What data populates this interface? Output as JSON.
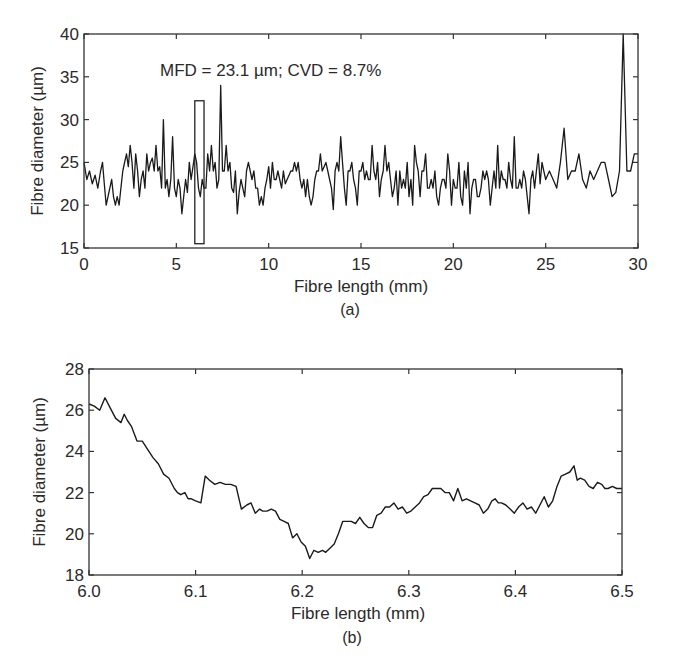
{
  "chart_data": [
    {
      "id": "a",
      "type": "line",
      "caption": "(a)",
      "title": "",
      "annotation": "MFD = 23.1 µm; CVD = 8.7%",
      "xlabel": "Fibre length (mm)",
      "ylabel": "Fibre diameter (µm)",
      "xlim": [
        0,
        30
      ],
      "ylim": [
        15,
        40
      ],
      "xticks": [
        0,
        5,
        10,
        15,
        20,
        25,
        30
      ],
      "yticks": [
        15,
        20,
        25,
        30,
        35,
        40
      ],
      "grid": false,
      "legend": null,
      "highlight_box": {
        "x0": 6.0,
        "x1": 6.5,
        "y0": 15.5,
        "y1": 32.2,
        "note": "region enlarged in (b)"
      },
      "series": [
        {
          "name": "fibre diameter",
          "color": "#1a1a1a",
          "x": [
            0,
            0.15,
            0.3,
            0.45,
            0.6,
            0.75,
            0.9,
            1.0,
            1.1,
            1.2,
            1.35,
            1.5,
            1.6,
            1.7,
            1.8,
            1.9,
            2.0,
            2.1,
            2.2,
            2.3,
            2.4,
            2.5,
            2.6,
            2.7,
            2.8,
            2.9,
            3.0,
            3.1,
            3.2,
            3.3,
            3.4,
            3.5,
            3.6,
            3.7,
            3.8,
            3.9,
            4.0,
            4.1,
            4.2,
            4.3,
            4.4,
            4.5,
            4.6,
            4.7,
            4.8,
            4.9,
            5.0,
            5.1,
            5.2,
            5.3,
            5.4,
            5.5,
            5.6,
            5.7,
            5.8,
            5.9,
            6.0,
            6.1,
            6.2,
            6.3,
            6.4,
            6.5,
            6.6,
            6.7,
            6.8,
            6.9,
            7.0,
            7.1,
            7.2,
            7.3,
            7.4,
            7.5,
            7.6,
            7.7,
            7.8,
            7.9,
            8.0,
            8.1,
            8.2,
            8.3,
            8.4,
            8.5,
            8.6,
            8.7,
            8.8,
            8.9,
            9.0,
            9.1,
            9.2,
            9.3,
            9.4,
            9.5,
            9.6,
            9.7,
            9.8,
            9.9,
            10.0,
            10.1,
            10.2,
            10.3,
            10.4,
            10.5,
            10.6,
            10.7,
            10.8,
            10.9,
            11.0,
            11.1,
            11.2,
            11.3,
            11.4,
            11.5,
            11.6,
            11.7,
            11.8,
            11.9,
            12.0,
            12.1,
            12.2,
            12.3,
            12.4,
            12.5,
            12.6,
            12.7,
            12.8,
            12.9,
            13.0,
            13.1,
            13.2,
            13.3,
            13.4,
            13.5,
            13.6,
            13.7,
            13.8,
            13.9,
            14.0,
            14.1,
            14.2,
            14.3,
            14.4,
            14.5,
            14.6,
            14.7,
            14.8,
            14.9,
            15.0,
            15.1,
            15.2,
            15.3,
            15.4,
            15.5,
            15.6,
            15.7,
            15.8,
            15.9,
            16.0,
            16.1,
            16.2,
            16.3,
            16.4,
            16.5,
            16.6,
            16.7,
            16.8,
            16.9,
            17.0,
            17.1,
            17.2,
            17.3,
            17.4,
            17.5,
            17.6,
            17.7,
            17.8,
            17.9,
            18.0,
            18.1,
            18.2,
            18.3,
            18.4,
            18.5,
            18.6,
            18.7,
            18.8,
            18.9,
            19.0,
            19.1,
            19.2,
            19.3,
            19.4,
            19.5,
            19.6,
            19.7,
            19.8,
            19.9,
            20.0,
            20.1,
            20.2,
            20.3,
            20.4,
            20.5,
            20.6,
            20.7,
            20.8,
            20.9,
            21.0,
            21.1,
            21.2,
            21.3,
            21.4,
            21.5,
            21.6,
            21.7,
            21.8,
            21.9,
            22.0,
            22.1,
            22.2,
            22.3,
            22.4,
            22.5,
            22.6,
            22.7,
            22.8,
            22.9,
            23.0,
            23.1,
            23.2,
            23.3,
            23.4,
            23.5,
            23.6,
            23.7,
            23.8,
            23.9,
            24.0,
            24.1,
            24.2,
            24.3,
            24.4,
            24.5,
            24.6,
            24.7,
            24.8,
            24.9,
            25.0,
            25.2,
            25.4,
            25.6,
            25.8,
            26.0,
            26.2,
            26.4,
            26.6,
            26.8,
            27.0,
            27.2,
            27.4,
            27.6,
            27.8,
            28.0,
            28.2,
            28.4,
            28.6,
            28.8,
            29.0,
            29.2,
            29.4,
            29.6,
            29.8,
            30.0
          ],
          "y": [
            25,
            23,
            24,
            22.5,
            23.5,
            22,
            24,
            25,
            22.5,
            20,
            21.5,
            23,
            21,
            20,
            21,
            20,
            22,
            24,
            25,
            26,
            24.5,
            27,
            25,
            22,
            26,
            24,
            21,
            23,
            24,
            22,
            26,
            24,
            25,
            25.5,
            24,
            27,
            24,
            24.5,
            22,
            30,
            22,
            23,
            21,
            23,
            28,
            22,
            21,
            23,
            22,
            19,
            21,
            23,
            21.5,
            25,
            23,
            24.5,
            26,
            25,
            22,
            21,
            23,
            22,
            22,
            26,
            24,
            27,
            24,
            25,
            22,
            23,
            34,
            24,
            24,
            27,
            24,
            25,
            22,
            21.5,
            24,
            19,
            21.5,
            23,
            22,
            21,
            24,
            25,
            24,
            23,
            24,
            22,
            22,
            20,
            21,
            20,
            22,
            23,
            24.5,
            22,
            25,
            23,
            23,
            24,
            23,
            22,
            24,
            22.5,
            23,
            23.5,
            24,
            24,
            25,
            24,
            25,
            23,
            22,
            23,
            21,
            23,
            21,
            20,
            21,
            23,
            24,
            24,
            26,
            24,
            24.5,
            25,
            24,
            23,
            22,
            19.5,
            24,
            25,
            24,
            28,
            25,
            22,
            20,
            24,
            24,
            25,
            23,
            22,
            20,
            24,
            24,
            25,
            23,
            24,
            23,
            23,
            27,
            24,
            23,
            25,
            21,
            23,
            24,
            27,
            24,
            25,
            23,
            21,
            22,
            24,
            20,
            24,
            22,
            23,
            22,
            25,
            21,
            23,
            20,
            27,
            25,
            24,
            21,
            24,
            24,
            26,
            22,
            22,
            23,
            22,
            24,
            21,
            20,
            22,
            23,
            23,
            22,
            26,
            24,
            20,
            23,
            22,
            22,
            25,
            21,
            20,
            24,
            22,
            25,
            19,
            22,
            23,
            23,
            21,
            21,
            22,
            24,
            23,
            24,
            23,
            20,
            22,
            24,
            22,
            27,
            22,
            24,
            23,
            23,
            22,
            25,
            23,
            22,
            28,
            22,
            22,
            23,
            22,
            24,
            23,
            21,
            19,
            23,
            24,
            22,
            24,
            26,
            22.5,
            25,
            24,
            23,
            24,
            23,
            22,
            25,
            29,
            23,
            24,
            24,
            26,
            23,
            22,
            24,
            23,
            24,
            25,
            25,
            23,
            21,
            21.5,
            24,
            40,
            24,
            24,
            26,
            26,
            23,
            22,
            22,
            23,
            24.5,
            22,
            20.5,
            21,
            23,
            22,
            23,
            24,
            21.5,
            21,
            22,
            23,
            22,
            21,
            22,
            23,
            22,
            21,
            23.5,
            22,
            22,
            23,
            25,
            20,
            23,
            21,
            22,
            23,
            21,
            22,
            23,
            21,
            21
          ]
        }
      ]
    },
    {
      "id": "b",
      "type": "line",
      "caption": "(b)",
      "title": "",
      "xlabel": "Fibre length (mm)",
      "ylabel": "Fibre diameter (µm)",
      "xlim": [
        6.0,
        6.5
      ],
      "ylim": [
        18,
        28
      ],
      "xticks": [
        6.0,
        6.1,
        6.2,
        6.3,
        6.4,
        6.5
      ],
      "xtick_labels": [
        "6.0",
        "6.1",
        "6.2",
        "6.3",
        "6.4",
        "6.5"
      ],
      "yticks": [
        18,
        20,
        22,
        24,
        26,
        28
      ],
      "grid": false,
      "legend": null,
      "series": [
        {
          "name": "fibre diameter (zoomed)",
          "color": "#1a1a1a",
          "x": [
            6.0,
            6.005,
            6.01,
            6.015,
            6.02,
            6.025,
            6.03,
            6.033,
            6.036,
            6.04,
            6.045,
            6.05,
            6.055,
            6.06,
            6.065,
            6.07,
            6.075,
            6.08,
            6.083,
            6.086,
            6.09,
            6.093,
            6.096,
            6.1,
            6.105,
            6.109,
            6.113,
            6.118,
            6.123,
            6.128,
            6.133,
            6.138,
            6.143,
            6.148,
            6.152,
            6.156,
            6.16,
            6.163,
            6.167,
            6.171,
            6.175,
            6.179,
            6.183,
            6.187,
            6.191,
            6.195,
            6.199,
            6.203,
            6.207,
            6.211,
            6.215,
            6.219,
            6.222,
            6.226,
            6.23,
            6.234,
            6.238,
            6.242,
            6.246,
            6.25,
            6.254,
            6.258,
            6.262,
            6.266,
            6.27,
            6.274,
            6.278,
            6.282,
            6.286,
            6.29,
            6.294,
            6.298,
            6.302,
            6.306,
            6.31,
            6.314,
            6.318,
            6.322,
            6.326,
            6.33,
            6.334,
            6.338,
            6.342,
            6.346,
            6.35,
            6.354,
            6.358,
            6.362,
            6.366,
            6.37,
            6.374,
            6.378,
            6.381,
            6.384,
            6.387,
            6.391,
            6.395,
            6.399,
            6.403,
            6.407,
            6.411,
            6.415,
            6.419,
            6.423,
            6.427,
            6.431,
            6.435,
            6.439,
            6.443,
            6.447,
            6.451,
            6.455,
            6.458,
            6.461,
            6.465,
            6.469,
            6.473,
            6.477,
            6.481,
            6.484,
            6.487,
            6.491,
            6.495,
            6.5
          ],
          "y": [
            26.3,
            26.2,
            26.0,
            26.6,
            26.1,
            25.6,
            25.4,
            25.8,
            25.5,
            25.2,
            24.5,
            24.5,
            24.1,
            23.7,
            23.4,
            22.9,
            22.7,
            22.2,
            22.0,
            21.9,
            22.0,
            21.7,
            21.7,
            21.6,
            21.5,
            22.8,
            22.6,
            22.4,
            22.5,
            22.4,
            22.4,
            22.3,
            21.2,
            21.4,
            21.5,
            21.0,
            21.2,
            21.1,
            21.1,
            21.2,
            21.1,
            20.7,
            20.6,
            20.5,
            19.8,
            20.0,
            19.6,
            19.4,
            18.8,
            19.2,
            19.1,
            19.2,
            19.1,
            19.3,
            19.5,
            20.0,
            20.6,
            20.6,
            20.6,
            20.5,
            20.8,
            20.5,
            20.3,
            20.3,
            20.9,
            21.0,
            21.3,
            21.3,
            21.5,
            21.2,
            21.3,
            21.0,
            21.1,
            21.3,
            21.5,
            21.8,
            21.9,
            22.2,
            22.2,
            22.2,
            22.0,
            22.0,
            21.6,
            22.2,
            21.6,
            21.7,
            21.6,
            21.5,
            21.4,
            21.0,
            21.2,
            21.6,
            21.7,
            21.5,
            21.5,
            21.4,
            21.2,
            21.0,
            21.3,
            21.5,
            21.2,
            21.3,
            21.0,
            21.4,
            21.8,
            21.3,
            21.6,
            22.3,
            22.8,
            22.9,
            23.0,
            23.3,
            22.6,
            22.7,
            22.6,
            22.3,
            22.2,
            22.5,
            22.4,
            22.2,
            22.2,
            22.3,
            22.2,
            22.2
          ]
        }
      ]
    }
  ],
  "panels": {
    "a": {
      "caption": "(a)",
      "annotation": "MFD = 23.1 µm; CVD = 8.7%",
      "xlabel": "Fibre length (mm)",
      "ylabel": "Fibre diameter (µm)"
    },
    "b": {
      "caption": "(b)",
      "xlabel": "Fibre length (mm)",
      "ylabel": "Fibre diameter (µm)"
    }
  }
}
